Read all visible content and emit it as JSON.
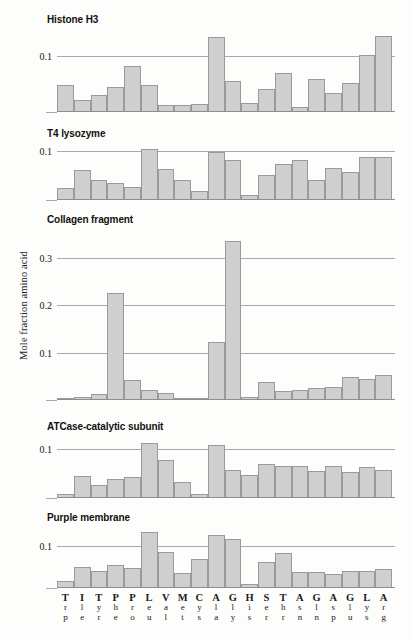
{
  "figure": {
    "ylabel": "Mole fraction amino acid"
  },
  "chart_data": [
    {
      "type": "bar",
      "title": "Histone H3",
      "xlabel": "",
      "ylabel": "Mole fraction amino acid",
      "ylim": [
        0,
        0.145
      ],
      "grid": true,
      "tick_labels": [
        "0.1"
      ],
      "ticks": [
        0.1
      ],
      "categories": [
        "Trp",
        "Ile",
        "Tyr",
        "Phe",
        "Pro",
        "Leu",
        "Val",
        "Met",
        "Cys",
        "Ala",
        "Gly",
        "His",
        "Ser",
        "Thr",
        "Asn",
        "Gln",
        "Asp",
        "Glu",
        "Lys",
        "Arg"
      ],
      "values": [
        0.047,
        0.019,
        0.029,
        0.043,
        0.08,
        0.046,
        0.011,
        0.011,
        0.012,
        0.133,
        0.053,
        0.014,
        0.039,
        0.068,
        0.008,
        0.058,
        0.033,
        0.051,
        0.1,
        0.135
      ]
    },
    {
      "type": "bar",
      "title": "T4 lysozyme",
      "xlabel": "",
      "ylabel": "Mole fraction amino acid",
      "ylim": [
        0,
        0.112
      ],
      "grid": true,
      "tick_labels": [
        "0.1"
      ],
      "ticks": [
        0.1
      ],
      "categories": [
        "Trp",
        "Ile",
        "Tyr",
        "Phe",
        "Pro",
        "Leu",
        "Val",
        "Met",
        "Cys",
        "Ala",
        "Gly",
        "His",
        "Ser",
        "Thr",
        "Asn",
        "Gln",
        "Asp",
        "Glu",
        "Lys",
        "Arg"
      ],
      "values": [
        0.023,
        0.059,
        0.038,
        0.033,
        0.024,
        0.101,
        0.062,
        0.038,
        0.016,
        0.096,
        0.079,
        0.008,
        0.048,
        0.072,
        0.079,
        0.038,
        0.063,
        0.055,
        0.086,
        0.086
      ]
    },
    {
      "type": "bar",
      "title": "Collagen fragment",
      "xlabel": "",
      "ylabel": "Mole fraction amino acid",
      "ylim": [
        0,
        0.355
      ],
      "grid": true,
      "tick_labels": [
        "0.1",
        "0.2",
        "0.3"
      ],
      "ticks": [
        0.1,
        0.2,
        0.3
      ],
      "categories": [
        "Trp",
        "Ile",
        "Tyr",
        "Phe",
        "Pro",
        "Leu",
        "Val",
        "Met",
        "Cys",
        "Ala",
        "Gly",
        "His",
        "Ser",
        "Thr",
        "Asn",
        "Gln",
        "Asp",
        "Glu",
        "Lys",
        "Arg"
      ],
      "values": [
        0.003,
        0.004,
        0.011,
        0.224,
        0.04,
        0.018,
        0.013,
        0.003,
        0.002,
        0.12,
        0.333,
        0.004,
        0.036,
        0.017,
        0.019,
        0.024,
        0.026,
        0.046,
        0.042,
        0.05
      ]
    },
    {
      "type": "bar",
      "title": "ATCase-catalytic subunit",
      "xlabel": "",
      "ylabel": "Mole fraction amino acid",
      "ylim": [
        0,
        0.122
      ],
      "grid": true,
      "tick_labels": [
        "0.1"
      ],
      "ticks": [
        0.1
      ],
      "categories": [
        "Trp",
        "Ile",
        "Tyr",
        "Phe",
        "Pro",
        "Leu",
        "Val",
        "Met",
        "Cys",
        "Ala",
        "Gly",
        "His",
        "Ser",
        "Thr",
        "Asn",
        "Gln",
        "Asp",
        "Glu",
        "Lys",
        "Arg"
      ],
      "values": [
        0.006,
        0.043,
        0.024,
        0.036,
        0.041,
        0.11,
        0.076,
        0.031,
        0.007,
        0.105,
        0.055,
        0.045,
        0.068,
        0.063,
        0.063,
        0.052,
        0.064,
        0.051,
        0.062,
        0.055
      ]
    },
    {
      "type": "bar",
      "title": "Purple membrane",
      "xlabel": "",
      "ylabel": "Mole fraction amino acid",
      "ylim": [
        0,
        0.14
      ],
      "grid": true,
      "tick_labels": [
        "0.1"
      ],
      "ticks": [
        0.1
      ],
      "categories": [
        "Trp",
        "Ile",
        "Tyr",
        "Phe",
        "Pro",
        "Leu",
        "Val",
        "Met",
        "Cys",
        "Ala",
        "Gly",
        "His",
        "Ser",
        "Thr",
        "Asn",
        "Gln",
        "Asp",
        "Glu",
        "Lys",
        "Arg"
      ],
      "values": [
        0.014,
        0.048,
        0.039,
        0.053,
        0.045,
        0.13,
        0.083,
        0.033,
        0.067,
        0.124,
        0.113,
        0.006,
        0.059,
        0.08,
        0.035,
        0.036,
        0.031,
        0.038,
        0.037,
        0.042
      ]
    }
  ],
  "xaxis": {
    "columns": [
      {
        "l1": "T",
        "l2": "r",
        "l3": "p",
        "code": "Trp"
      },
      {
        "l1": "I",
        "l2": "l",
        "l3": "e",
        "code": "Ile"
      },
      {
        "l1": "T",
        "l2": "y",
        "l3": "r",
        "code": "Tyr"
      },
      {
        "l1": "P",
        "l2": "h",
        "l3": "e",
        "code": "Phe"
      },
      {
        "l1": "P",
        "l2": "r",
        "l3": "o",
        "code": "Pro"
      },
      {
        "l1": "L",
        "l2": "e",
        "l3": "u",
        "code": "Leu"
      },
      {
        "l1": "V",
        "l2": "a",
        "l3": "l",
        "code": "Val"
      },
      {
        "l1": "M",
        "l2": "e",
        "l3": "t",
        "code": "Met"
      },
      {
        "l1": "C",
        "l2": "y",
        "l3": "s",
        "code": "Cys"
      },
      {
        "l1": "A",
        "l2": "l",
        "l3": "a",
        "code": "Ala"
      },
      {
        "l1": "G",
        "l2": "l",
        "l3": "y",
        "code": "Gly"
      },
      {
        "l1": "H",
        "l2": "i",
        "l3": "s",
        "code": "His"
      },
      {
        "l1": "S",
        "l2": "e",
        "l3": "r",
        "code": "Ser"
      },
      {
        "l1": "T",
        "l2": "h",
        "l3": "r",
        "code": "Thr"
      },
      {
        "l1": "A",
        "l2": "s",
        "l3": "n",
        "code": "Asn"
      },
      {
        "l1": "G",
        "l2": "l",
        "l3": "n",
        "code": "Gln"
      },
      {
        "l1": "A",
        "l2": "s",
        "l3": "p",
        "code": "Asp"
      },
      {
        "l1": "G",
        "l2": "l",
        "l3": "u",
        "code": "Glu"
      },
      {
        "l1": "L",
        "l2": "y",
        "l3": "s",
        "code": "Lys"
      },
      {
        "l1": "A",
        "l2": "r",
        "l3": "g",
        "code": "Arg"
      }
    ]
  },
  "style": {
    "bar_fill": "#cfcfcf",
    "bar_stroke": "#9a9a9a",
    "axis_color": "#8e8e8e",
    "grid_color": "#a9a9a9",
    "background": "#fdfdfb"
  }
}
